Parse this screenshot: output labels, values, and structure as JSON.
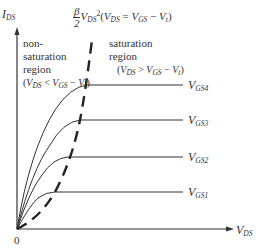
{
  "diagram": {
    "type": "MOSFET output characteristics (I_DS vs V_DS)",
    "axes": {
      "y_label_main": "I",
      "y_label_sub": "DS",
      "x_label_main": "V",
      "x_label_sub": "DS",
      "origin_label": "0"
    },
    "boundary_curve": {
      "frac_num": "β",
      "frac_den": "2",
      "expr_main": "V",
      "expr_sub": "DS",
      "expr_sup": "2",
      "condition": "(V_DS = V_GS − V_t)",
      "cond_open": "(",
      "cond_v1": "V",
      "cond_v1_sub": "DS",
      "cond_eq": " = ",
      "cond_v2": "V",
      "cond_v2_sub": "GS",
      "cond_minus": " − ",
      "cond_v3": "V",
      "cond_v3_sub": "t",
      "cond_close": ")",
      "style": "dashed"
    },
    "regions": {
      "nonsat": {
        "line1": "non-",
        "line2": "saturation",
        "line3": "region",
        "cond_open": "(",
        "v1": "V",
        "v1_sub": "DS",
        "op": " < ",
        "v2": "V",
        "v2_sub": "GS",
        "minus": " − ",
        "v3": "V",
        "v3_sub": "t",
        "cond_close": ")"
      },
      "sat": {
        "line1": "saturation",
        "line2": "region",
        "cond_open": "(",
        "v1": "V",
        "v1_sub": "DS",
        "op": " > ",
        "v2": "V",
        "v2_sub": "GS",
        "minus": " − ",
        "v3": "V",
        "v3_sub": "t",
        "cond_close": ")"
      }
    },
    "curves": [
      {
        "name": "V",
        "sub": "GS4",
        "plateau_y": 85,
        "knee_x": 87
      },
      {
        "name": "V",
        "sub": "GS3",
        "plateau_y": 120,
        "knee_x": 80
      },
      {
        "name": "V",
        "sub": "GS2",
        "plateau_y": 157,
        "knee_x": 68
      },
      {
        "name": "V",
        "sub": "GS1",
        "plateau_y": 192,
        "knee_x": 55
      }
    ]
  }
}
